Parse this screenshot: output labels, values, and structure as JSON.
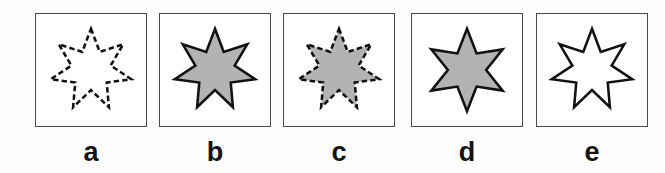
{
  "figure": {
    "type": "multiple-choice-shape-panels",
    "background_color": "#fdfdfd",
    "panel_background": "#ffffff",
    "panel_border_color": "#4a4a4a",
    "fill_gray": "#b3b3b3",
    "outline_color": "#111111",
    "label_color": "#131313"
  },
  "panels": [
    {
      "label": "a",
      "shape_name": "seven-pointed-star",
      "points": 7,
      "fill": "none",
      "fill_color": "#ffffff",
      "stroke_style": "dashed",
      "stroke_color": "#111111",
      "stroke_width": 2.6
    },
    {
      "label": "b",
      "shape_name": "seven-pointed-star",
      "points": 7,
      "fill": "gray",
      "fill_color": "#b3b3b3",
      "stroke_style": "solid",
      "stroke_color": "#111111",
      "stroke_width": 2.6
    },
    {
      "label": "c",
      "shape_name": "seven-pointed-star",
      "points": 7,
      "fill": "gray",
      "fill_color": "#b3b3b3",
      "stroke_style": "dashed",
      "stroke_color": "#111111",
      "stroke_width": 2.6
    },
    {
      "label": "d",
      "shape_name": "six-pointed-star",
      "points": 6,
      "fill": "gray",
      "fill_color": "#b3b3b3",
      "stroke_style": "solid",
      "stroke_color": "#111111",
      "stroke_width": 2.6
    },
    {
      "label": "e",
      "shape_name": "seven-pointed-star",
      "points": 7,
      "fill": "none",
      "fill_color": "#ffffff",
      "stroke_style": "solid",
      "stroke_color": "#111111",
      "stroke_width": 2.6
    }
  ]
}
